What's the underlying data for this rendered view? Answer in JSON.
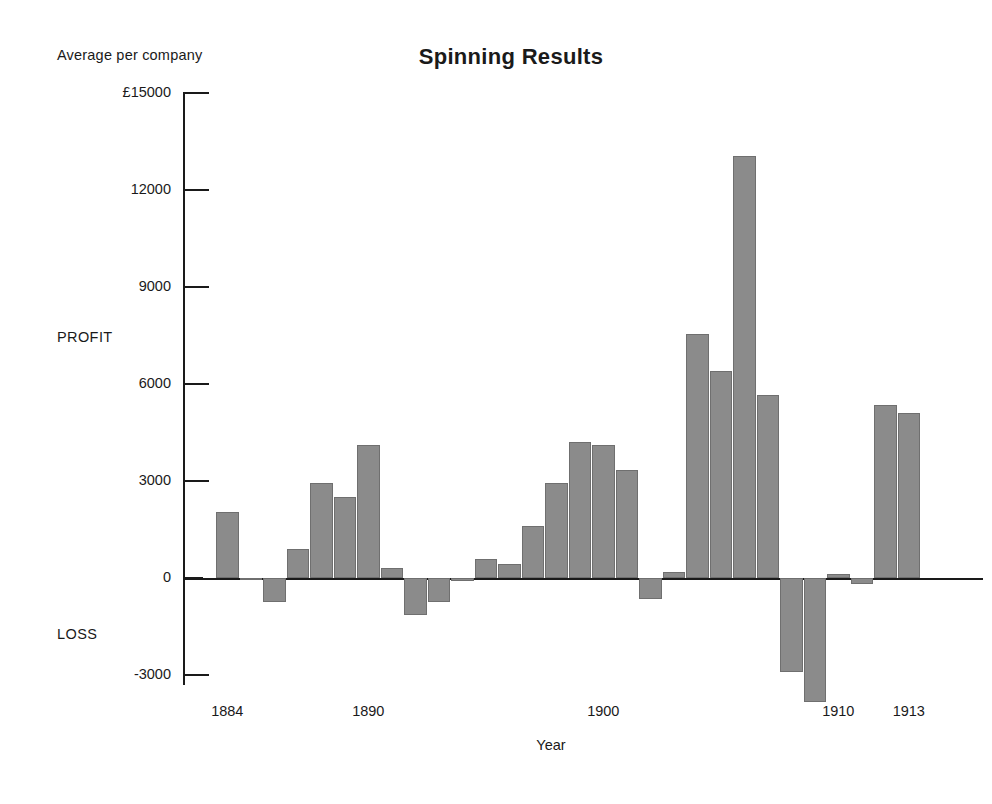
{
  "chart_data": {
    "type": "bar",
    "title": "Spinning Results",
    "ylabel": "Average per company",
    "xlabel": "Year",
    "grid": false,
    "legend": null,
    "ylim": [
      -3000,
      15000
    ],
    "y_axis_note": "Values above zero are PROFIT, below zero are LOSS",
    "ytick_labels": [
      "£15000",
      "12000",
      "9000",
      "6000",
      "3000",
      "0",
      "-3000"
    ],
    "ytick_values": [
      15000,
      12000,
      9000,
      6000,
      3000,
      0,
      -3000
    ],
    "side_captions": {
      "positive": "PROFIT",
      "negative": "LOSS"
    },
    "xtick_labels": [
      "1884",
      "1890",
      "1900",
      "1910",
      "1913"
    ],
    "xtick_values": [
      1884,
      1890,
      1900,
      1910,
      1913
    ],
    "categories": [
      1884,
      1885,
      1886,
      1887,
      1888,
      1889,
      1890,
      1891,
      1892,
      1893,
      1894,
      1895,
      1896,
      1897,
      1898,
      1899,
      1900,
      1901,
      1902,
      1903,
      1904,
      1905,
      1906,
      1907,
      1908,
      1909,
      1910,
      1911,
      1912,
      1913
    ],
    "values": [
      2050,
      -60,
      -750,
      900,
      2950,
      2500,
      4100,
      300,
      -1150,
      -750,
      -90,
      580,
      430,
      1600,
      2950,
      4200,
      4100,
      3350,
      -650,
      190,
      7550,
      6400,
      13050,
      5650,
      -2900,
      -3850,
      120,
      -180,
      5350,
      5100
    ]
  },
  "labels": {
    "title": "Spinning Results",
    "y_axis_caption": "Average per company",
    "x_axis_caption": "Year",
    "profit": "PROFIT",
    "loss": "LOSS"
  }
}
